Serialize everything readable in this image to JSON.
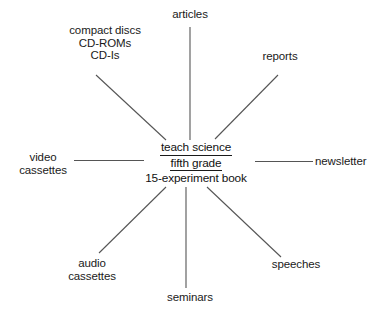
{
  "diagram": {
    "type": "cluster-concept-map",
    "title_center": {
      "lines": [
        {
          "text": "teach science",
          "underlined": true
        },
        {
          "text": "fifth grade",
          "underlined": true
        },
        {
          "text": "15-experiment book",
          "underlined": false
        }
      ]
    },
    "nodes": [
      {
        "id": "articles",
        "label_lines": [
          "articles"
        ],
        "position": "top",
        "connector": "vertical-line"
      },
      {
        "id": "compact-discs",
        "label_lines": [
          "compact discs",
          "CD-ROMs",
          "CD-Is"
        ],
        "position": "upper-left",
        "connector": "diagonal-line"
      },
      {
        "id": "reports",
        "label_lines": [
          "reports"
        ],
        "position": "upper-right",
        "connector": "diagonal-line"
      },
      {
        "id": "video-cassettes",
        "label_lines": [
          "video",
          "cassettes"
        ],
        "position": "left",
        "connector": "horizontal-line"
      },
      {
        "id": "newsletter",
        "label_lines": [
          "newsletter"
        ],
        "position": "right",
        "connector": "horizontal-line"
      },
      {
        "id": "audio-cassettes",
        "label_lines": [
          "audio",
          "cassettes"
        ],
        "position": "lower-left",
        "connector": "diagonal-line"
      },
      {
        "id": "speeches",
        "label_lines": [
          "speeches"
        ],
        "position": "lower-right",
        "connector": "diagonal-line"
      },
      {
        "id": "seminars",
        "label_lines": [
          "seminars"
        ],
        "position": "bottom",
        "connector": "vertical-line"
      }
    ],
    "colors": {
      "ink": "#1a1a1a",
      "line": "#555555",
      "background": "#ffffff"
    }
  }
}
